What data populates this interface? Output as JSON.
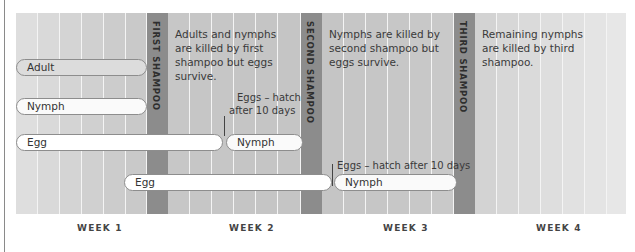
{
  "colors": {
    "band": "#8c8c8c",
    "column_mid": "#c6c6c6",
    "column_edge": "#e6e6e6",
    "pill_border": "#8d8d8d",
    "adult_fill": "#dcdcdc",
    "pill_fill": "#fafafa"
  },
  "shampoos": [
    {
      "label": "FIRST SHAMPOO",
      "note": "Adults and nymphs are killed by first shampoo but eggs survive."
    },
    {
      "label": "SECOND SHAMPOO",
      "note": "Nymphs are killed by second shampoo but eggs survive."
    },
    {
      "label": "THIRD SHAMPOO",
      "note": "Remaining nymphs are killed by third shampoo."
    }
  ],
  "stages": {
    "adult": "Adult",
    "nymph1": "Nymph",
    "egg1": "Egg",
    "nymph2": "Nymph",
    "egg2": "Egg",
    "nymph3": "Nymph"
  },
  "annotations": {
    "hatch1_line1": "Eggs – hatch",
    "hatch1_line2": "after 10 days",
    "hatch2": "Eggs – hatch after 10 days"
  },
  "weeks": [
    "WEEK 1",
    "WEEK 2",
    "WEEK 3",
    "WEEK 4"
  ]
}
